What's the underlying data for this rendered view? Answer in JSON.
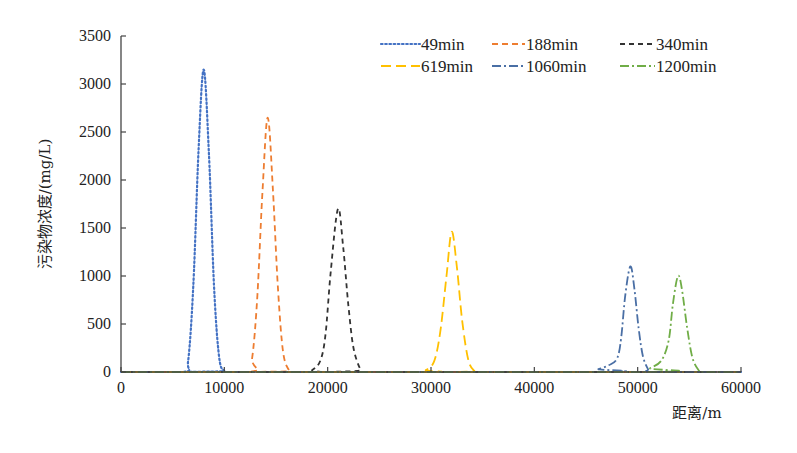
{
  "chart_data": {
    "type": "line",
    "title": "",
    "xlabel": "距离/m",
    "ylabel": "污染物浓度/(mg/L)",
    "xlim": [
      0,
      60000
    ],
    "ylim": [
      0,
      3500
    ],
    "xticks": [
      0,
      10000,
      20000,
      30000,
      40000,
      50000,
      60000
    ],
    "yticks": [
      0,
      500,
      1000,
      1500,
      2000,
      2500,
      3000,
      3500
    ],
    "grid": false,
    "legend_position": "upper right",
    "series": [
      {
        "name": "49min",
        "color": "#4472c4",
        "dash": "dotted",
        "peak_x": 8000,
        "peak_y": 3150,
        "points": [
          [
            0,
            0
          ],
          [
            6000,
            0
          ],
          [
            6500,
            120
          ],
          [
            7000,
            900
          ],
          [
            7500,
            2300
          ],
          [
            8000,
            3150
          ],
          [
            8500,
            2300
          ],
          [
            9000,
            900
          ],
          [
            9500,
            150
          ],
          [
            10000,
            10
          ],
          [
            10300,
            0
          ],
          [
            60000,
            0
          ]
        ]
      },
      {
        "name": "188min",
        "color": "#ed7d31",
        "dash": "dashed",
        "peak_x": 14200,
        "peak_y": 2650,
        "points": [
          [
            0,
            0
          ],
          [
            12200,
            0
          ],
          [
            12700,
            150
          ],
          [
            13200,
            800
          ],
          [
            13700,
            1900
          ],
          [
            14200,
            2650
          ],
          [
            14700,
            1900
          ],
          [
            15200,
            850
          ],
          [
            15700,
            200
          ],
          [
            16300,
            10
          ],
          [
            16600,
            0
          ],
          [
            60000,
            0
          ]
        ]
      },
      {
        "name": "340min",
        "color": "#333333",
        "dash": "dashed-dark",
        "peak_x": 21000,
        "peak_y": 1700,
        "points": [
          [
            0,
            0
          ],
          [
            17800,
            0
          ],
          [
            18500,
            20
          ],
          [
            19300,
            120
          ],
          [
            19800,
            400
          ],
          [
            20300,
            1050
          ],
          [
            21000,
            1700
          ],
          [
            21500,
            1300
          ],
          [
            22000,
            700
          ],
          [
            22500,
            250
          ],
          [
            23200,
            20
          ],
          [
            23600,
            0
          ],
          [
            60000,
            0
          ]
        ]
      },
      {
        "name": "619min",
        "color": "#ffc000",
        "dash": "long-dash",
        "peak_x": 32000,
        "peak_y": 1460,
        "points": [
          [
            0,
            0
          ],
          [
            28700,
            0
          ],
          [
            29500,
            20
          ],
          [
            30300,
            110
          ],
          [
            30900,
            420
          ],
          [
            31500,
            1000
          ],
          [
            32000,
            1460
          ],
          [
            32500,
            1100
          ],
          [
            33000,
            550
          ],
          [
            33600,
            130
          ],
          [
            34200,
            10
          ],
          [
            34600,
            0
          ],
          [
            60000,
            0
          ]
        ]
      },
      {
        "name": "1060min",
        "color": "#4a6fa5",
        "dash": "dash-dot",
        "peak_x": 49300,
        "peak_y": 1100,
        "points": [
          [
            0,
            0
          ],
          [
            45300,
            0
          ],
          [
            46200,
            30
          ],
          [
            47200,
            70
          ],
          [
            48000,
            140
          ],
          [
            48400,
            350
          ],
          [
            48800,
            800
          ],
          [
            49300,
            1100
          ],
          [
            49700,
            850
          ],
          [
            50100,
            450
          ],
          [
            50500,
            170
          ],
          [
            51000,
            30
          ],
          [
            51400,
            0
          ],
          [
            60000,
            0
          ]
        ]
      },
      {
        "name": "1200min",
        "color": "#70ad47",
        "dash": "dash-dot",
        "peak_x": 53900,
        "peak_y": 1000,
        "points": [
          [
            0,
            0
          ],
          [
            50200,
            0
          ],
          [
            51200,
            40
          ],
          [
            52300,
            120
          ],
          [
            53000,
            330
          ],
          [
            53400,
            700
          ],
          [
            53900,
            1000
          ],
          [
            54300,
            850
          ],
          [
            54800,
            450
          ],
          [
            55300,
            150
          ],
          [
            55900,
            20
          ],
          [
            56300,
            0
          ],
          [
            60000,
            0
          ]
        ]
      }
    ]
  }
}
